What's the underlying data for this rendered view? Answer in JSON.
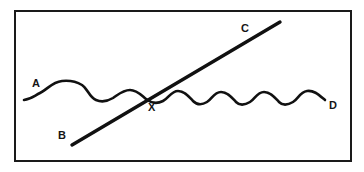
{
  "figure": {
    "width": 364,
    "height": 172,
    "background_color": "#ffffff",
    "stroke_color": "#111111",
    "frame": {
      "x": 14,
      "y": 10,
      "width": 338,
      "height": 152,
      "stroke_color": "#1a1a1a",
      "stroke_width": 2
    }
  },
  "labels": {
    "a": "A",
    "b": "B",
    "c": "C",
    "d": "D",
    "x": "X"
  },
  "chart_data": {
    "type": "line",
    "xlabel": "",
    "ylabel": "",
    "grid": false,
    "legend": "none",
    "xlim": [
      14,
      352
    ],
    "ylim": [
      10,
      162
    ],
    "series": [
      {
        "name": "A-D wave",
        "label_start": "A",
        "label_end": "D",
        "start_point": [
          24,
          100
        ],
        "end_point": [
          325,
          100
        ],
        "description": "Irregular wave: one broad flat-topped crest on the left followed by smaller regular sinusoidal oscillations to the right",
        "path": "M 24 100 C 31 99 34 96 40 93 C 48 89 52 82 62 81 C 72 80 77 82 82 85 C 88 89 89 97 96 100 C 103 103 108 101 113 98 C 119 94 123 90 130 90 C 137 90 141 95 146 99 C 151 103 157 104 163 101 C 169 98 171 91 178 91 C 185 91 189 97 193 101 C 197 105 202 105 207 102 C 212 99 214 92 221 92 C 228 92 232 98 236 102 C 240 106 245 105 250 102 C 255 99 257 92 264 92 C 271 92 275 98 279 102 C 283 106 288 105 293 102 C 298 99 300 92 307 91 C 314 90 319 95 325 100"
      },
      {
        "name": "B-C line",
        "label_start": "B",
        "label_end": "C",
        "start_point": [
          72,
          145
        ],
        "end_point": [
          280,
          22
        ],
        "description": "Straight diagonal line rising from lower-left to upper-right"
      }
    ],
    "annotations": [
      {
        "text": "A",
        "x": 37,
        "y": 84,
        "note": "left end of wave"
      },
      {
        "text": "B",
        "x": 63,
        "y": 136,
        "note": "lower-left end of straight line"
      },
      {
        "text": "C",
        "x": 246,
        "y": 29,
        "note": "upper-right end of straight line"
      },
      {
        "text": "D",
        "x": 334,
        "y": 106,
        "note": "right end of wave"
      },
      {
        "text": "X",
        "x": 153,
        "y": 108,
        "note": "intersection of wave and straight line"
      }
    ],
    "intersection_point": [
      150,
      100
    ]
  }
}
